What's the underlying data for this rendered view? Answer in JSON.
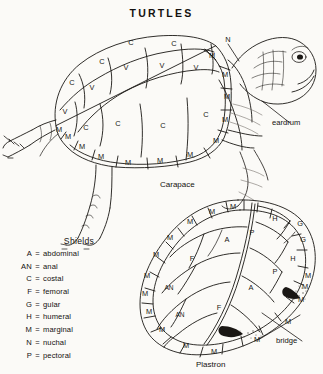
{
  "title": "TURTLES",
  "captions": {
    "carapace": "Carapace",
    "plastron": "Plastron"
  },
  "callouts": {
    "eardrum": "eardrum",
    "bridge": "bridge",
    "nuchal_pointer": "N"
  },
  "legend": {
    "heading": "Shields",
    "equals": "=",
    "entries": [
      {
        "key": "A",
        "name": "abdominal"
      },
      {
        "key": "AN",
        "name": "anal"
      },
      {
        "key": "C",
        "name": "costal"
      },
      {
        "key": "F",
        "name": "femoral"
      },
      {
        "key": "G",
        "name": "gular"
      },
      {
        "key": "H",
        "name": "humeral"
      },
      {
        "key": "M",
        "name": "marginal"
      },
      {
        "key": "N",
        "name": "nuchal"
      },
      {
        "key": "P",
        "name": "pectoral"
      }
    ]
  },
  "carapace_labels": [
    {
      "t": "C",
      "x": 131,
      "y": 43
    },
    {
      "t": "C",
      "x": 174,
      "y": 44
    },
    {
      "t": "C",
      "x": 102,
      "y": 62
    },
    {
      "t": "C",
      "x": 72,
      "y": 83
    },
    {
      "t": "V",
      "x": 126,
      "y": 68
    },
    {
      "t": "V",
      "x": 162,
      "y": 66
    },
    {
      "t": "V",
      "x": 196,
      "y": 68
    },
    {
      "t": "V",
      "x": 92,
      "y": 88
    },
    {
      "t": "V",
      "x": 65,
      "y": 112
    },
    {
      "t": "C",
      "x": 118,
      "y": 124
    },
    {
      "t": "C",
      "x": 163,
      "y": 126
    },
    {
      "t": "C",
      "x": 206,
      "y": 115
    },
    {
      "t": "C",
      "x": 86,
      "y": 128
    },
    {
      "t": "M",
      "x": 212,
      "y": 56
    },
    {
      "t": "M",
      "x": 225,
      "y": 75
    },
    {
      "t": "M",
      "x": 227,
      "y": 97
    },
    {
      "t": "M",
      "x": 225,
      "y": 120
    },
    {
      "t": "M",
      "x": 216,
      "y": 141
    },
    {
      "t": "M",
      "x": 190,
      "y": 155
    },
    {
      "t": "M",
      "x": 160,
      "y": 161
    },
    {
      "t": "M",
      "x": 128,
      "y": 163
    },
    {
      "t": "M",
      "x": 101,
      "y": 157
    },
    {
      "t": "M",
      "x": 82,
      "y": 147
    },
    {
      "t": "M",
      "x": 68,
      "y": 137
    },
    {
      "t": "M",
      "x": 59,
      "y": 130
    }
  ],
  "plastron_labels": [
    {
      "t": "M",
      "x": 233,
      "y": 207
    },
    {
      "t": "M",
      "x": 212,
      "y": 212
    },
    {
      "t": "M",
      "x": 190,
      "y": 222
    },
    {
      "t": "M",
      "x": 170,
      "y": 238
    },
    {
      "t": "M",
      "x": 156,
      "y": 255
    },
    {
      "t": "M",
      "x": 147,
      "y": 276
    },
    {
      "t": "M",
      "x": 145,
      "y": 294
    },
    {
      "t": "M",
      "x": 149,
      "y": 312
    },
    {
      "t": "M",
      "x": 162,
      "y": 330
    },
    {
      "t": "M",
      "x": 186,
      "y": 346
    },
    {
      "t": "M",
      "x": 214,
      "y": 352
    },
    {
      "t": "M",
      "x": 257,
      "y": 340
    },
    {
      "t": "M",
      "x": 288,
      "y": 322
    },
    {
      "t": "M",
      "x": 301,
      "y": 300
    },
    {
      "t": "M",
      "x": 305,
      "y": 287
    },
    {
      "t": "M",
      "x": 308,
      "y": 276
    },
    {
      "t": "H",
      "x": 275,
      "y": 219
    },
    {
      "t": "G",
      "x": 300,
      "y": 224
    },
    {
      "t": "G",
      "x": 303,
      "y": 240
    },
    {
      "t": "H",
      "x": 293,
      "y": 259
    },
    {
      "t": "P",
      "x": 252,
      "y": 233
    },
    {
      "t": "P",
      "x": 275,
      "y": 272
    },
    {
      "t": "A",
      "x": 227,
      "y": 240
    },
    {
      "t": "A",
      "x": 251,
      "y": 288
    },
    {
      "t": "F",
      "x": 192,
      "y": 259
    },
    {
      "t": "F",
      "x": 219,
      "y": 308
    },
    {
      "t": "AN",
      "x": 169,
      "y": 288
    },
    {
      "t": "AN",
      "x": 180,
      "y": 315
    }
  ]
}
